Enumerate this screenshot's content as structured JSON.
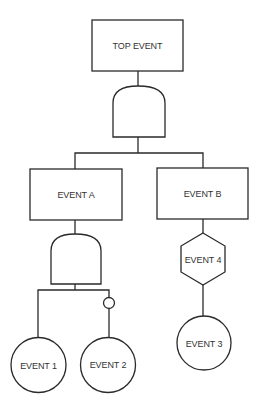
{
  "diagram": {
    "type": "fault-tree",
    "colors": {
      "line": "#2a2a2a",
      "text": "#333333",
      "background": "#ffffff"
    },
    "nodes": {
      "top_event": {
        "label": "TOP EVENT",
        "shape": "rectangle"
      },
      "gate_top": {
        "label": "",
        "shape": "and-gate"
      },
      "event_a": {
        "label": "EVENT A",
        "shape": "rectangle"
      },
      "event_b": {
        "label": "EVENT B",
        "shape": "rectangle"
      },
      "gate_a": {
        "label": "",
        "shape": "and-gate"
      },
      "inhibit": {
        "label": "",
        "shape": "small-circle-not"
      },
      "event_1": {
        "label": "EVENT 1",
        "shape": "circle"
      },
      "event_2": {
        "label": "EVENT 2",
        "shape": "circle"
      },
      "event_4": {
        "label": "EVENT 4",
        "shape": "hexagon"
      },
      "event_3": {
        "label": "EVENT 3",
        "shape": "circle"
      }
    },
    "edges": [
      [
        "top_event",
        "gate_top"
      ],
      [
        "gate_top",
        "event_a"
      ],
      [
        "gate_top",
        "event_b"
      ],
      [
        "event_a",
        "gate_a"
      ],
      [
        "gate_a",
        "event_1"
      ],
      [
        "gate_a",
        "inhibit"
      ],
      [
        "inhibit",
        "event_2"
      ],
      [
        "event_b",
        "event_4"
      ],
      [
        "event_4",
        "event_3"
      ]
    ]
  }
}
